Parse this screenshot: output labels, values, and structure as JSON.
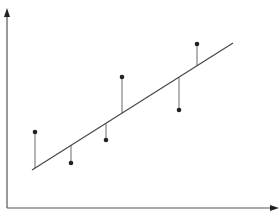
{
  "chart_data": {
    "type": "scatter",
    "title": "",
    "xlabel": "",
    "ylabel": "",
    "grid": false,
    "legend": null,
    "ticks": false,
    "points": [
      {
        "x": 35,
        "y": 132
      },
      {
        "x": 71,
        "y": 163
      },
      {
        "x": 106,
        "y": 140
      },
      {
        "x": 122,
        "y": 77
      },
      {
        "x": 179,
        "y": 110
      },
      {
        "x": 197,
        "y": 44
      }
    ],
    "fit_line": {
      "x1": 32,
      "y1": 170,
      "x2": 233,
      "y2": 43
    },
    "residuals": true,
    "colors": {
      "axis": "#555555",
      "line": "#444444",
      "point": "#222222",
      "residual": "#777777"
    }
  },
  "axes": {
    "origin": {
      "x": 7,
      "y": 208
    },
    "y_tip": {
      "x": 7,
      "y": 8
    },
    "x_tip": {
      "x": 279,
      "y": 208
    }
  }
}
